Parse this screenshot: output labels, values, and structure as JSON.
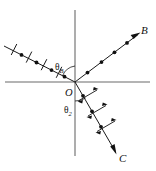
{
  "figure": {
    "background_color": "#ffffff",
    "axis_color": "#6a6a6a",
    "ray_color": "#1a1a1a",
    "width": 156,
    "height": 171
  },
  "labels": {
    "origin": "O",
    "reflected_ray_end": "B",
    "refracted_ray_end": "C",
    "angle_brewster": "θ",
    "angle_brewster_sub": "B",
    "angle_refraction": "θ",
    "angle_refraction_sub": "2"
  },
  "axes": {
    "horizontal": {
      "x1": 5,
      "y1": 82,
      "x2": 150,
      "y2": 82
    },
    "vertical": {
      "x1": 75,
      "y1": 10,
      "x2": 75,
      "y2": 156
    }
  },
  "rays": {
    "incident": {
      "name": "incident-ray",
      "from": {
        "x": 4,
        "y": 46
      },
      "to": {
        "x": 75,
        "y": 82
      },
      "polarization_dots": 4,
      "polarization_ticks": 4,
      "has_arrowhead": false
    },
    "reflected": {
      "name": "reflected-ray",
      "from": {
        "x": 75,
        "y": 82
      },
      "to": {
        "x": 140,
        "y": 33
      },
      "polarization_dots": 4,
      "polarization_ticks": 0,
      "has_arrowhead": true,
      "end_label": "B"
    },
    "refracted": {
      "name": "refracted-ray",
      "from": {
        "x": 75,
        "y": 82
      },
      "to": {
        "x": 117,
        "y": 155
      },
      "polarization_dots": 3,
      "polarization_ticks": 3,
      "has_arrowhead": true,
      "end_label": "C"
    }
  },
  "angles": {
    "brewster": {
      "label": "θ",
      "subscript": "B",
      "x": 58,
      "y": 66
    },
    "refraction": {
      "label": "θ",
      "subscript": "2",
      "x": 66,
      "y": 110
    }
  }
}
